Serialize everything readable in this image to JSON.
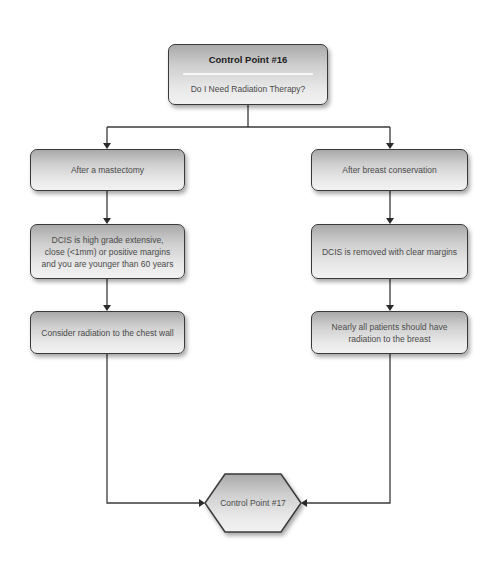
{
  "diagram": {
    "type": "flowchart",
    "start": {
      "title": "Control Point #16",
      "subtitle": "Do I Need Radiation Therapy?"
    },
    "left_branch": [
      {
        "label": "After a mastectomy"
      },
      {
        "label": "DCIS is high grade extensive, close (<1mm) or positive margins and you are younger than 60 years"
      },
      {
        "label": "Consider radiation to the chest wall"
      }
    ],
    "right_branch": [
      {
        "label": "After breast conservation"
      },
      {
        "label": "DCIS is removed with clear margins"
      },
      {
        "label": "Nearly all patients should have radiation to the breast"
      }
    ],
    "end": {
      "label": "Control Point #17",
      "shape": "hexagon"
    },
    "colors": {
      "stroke": "#3a3a3a",
      "box_gradient_top": "#a9a9a9",
      "box_gradient_bottom": "#f2f2f2",
      "text": "#4a4a4a",
      "title_text": "#1c1c1c"
    }
  }
}
